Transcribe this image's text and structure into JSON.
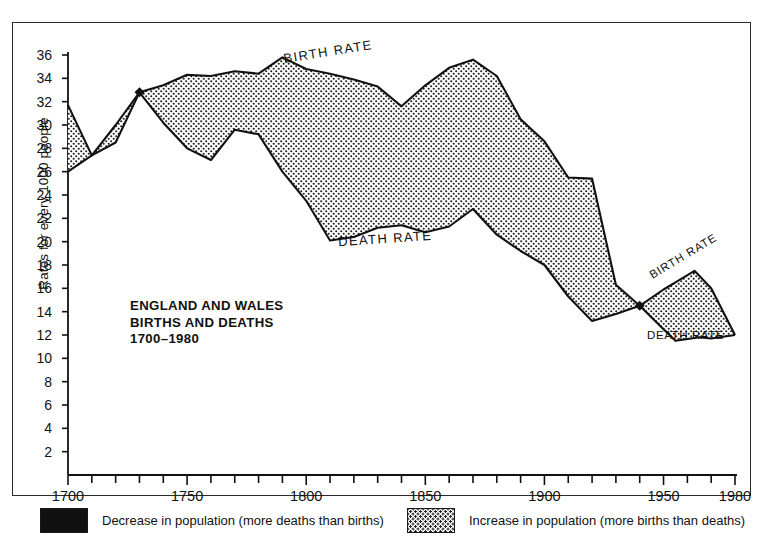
{
  "figure": {
    "title_lines": "ENGLAND AND WALES\nBIRTHS AND DEATHS\n1700–1980",
    "y_axis_label": "Rates for every 1000 people",
    "birth_label": "BIRTH RATE",
    "death_label": "DEATH RATE",
    "birth_label_right": "BIRTH RATE",
    "death_label_right": "DEATH RATE"
  },
  "legend": {
    "decrease": {
      "swatch": "solid-black",
      "text": "Decrease in population (more deaths than births)"
    },
    "increase": {
      "swatch": "dotted-screen",
      "text": "Increase in population (more births than deaths)"
    }
  },
  "colors": {
    "ink": "#111111",
    "fill_increase": "#ffffff",
    "fill_decrease": "#111111",
    "frame": "#2a2a2a"
  },
  "chart_data": {
    "type": "area",
    "xlabel": "",
    "ylabel": "Rates for every 1000 people",
    "xlim": [
      1700,
      1980
    ],
    "ylim": [
      0,
      36
    ],
    "grid": false,
    "legend_position": "below-plot",
    "x_ticks_major": [
      1700,
      1750,
      1800,
      1850,
      1900,
      1950,
      1980
    ],
    "x_ticks_minor_interval": 10,
    "y_ticks": [
      2,
      4,
      6,
      8,
      10,
      12,
      14,
      16,
      18,
      20,
      22,
      24,
      26,
      28,
      30,
      32,
      34,
      36
    ],
    "annotations": [
      {
        "text": "BIRTH RATE",
        "x": 1800,
        "y": 35.8
      },
      {
        "text": "DEATH RATE",
        "x": 1815,
        "y": 19.6
      },
      {
        "text": "BIRTH RATE",
        "x": 1958,
        "y": 17.6
      },
      {
        "text": "DEATH RATE",
        "x": 1962,
        "y": 11.0
      }
    ],
    "crossovers": [
      {
        "year": 1730,
        "rate": 32.8,
        "marker": "black-diamond",
        "note": "deaths exceed births"
      },
      {
        "year": 1940,
        "rate": 14.5,
        "marker": "black-diamond",
        "note": "deaths exceed births"
      }
    ],
    "series": [
      {
        "name": "BIRTH RATE",
        "x": [
          1700,
          1710,
          1720,
          1730,
          1740,
          1750,
          1760,
          1770,
          1780,
          1790,
          1800,
          1810,
          1820,
          1830,
          1840,
          1850,
          1860,
          1870,
          1880,
          1890,
          1900,
          1910,
          1920,
          1930,
          1940,
          1950,
          1963,
          1970,
          1980
        ],
        "values": [
          31.7,
          27.4,
          30.0,
          32.8,
          33.4,
          34.3,
          34.2,
          34.6,
          34.4,
          35.8,
          34.8,
          34.4,
          33.9,
          33.3,
          31.6,
          33.4,
          34.9,
          35.6,
          34.2,
          30.5,
          28.6,
          25.5,
          25.4,
          16.3,
          14.5,
          15.9,
          17.5,
          16.0,
          12.0
        ],
        "label_inside": true
      },
      {
        "name": "DEATH RATE",
        "x": [
          1700,
          1710,
          1720,
          1730,
          1740,
          1750,
          1760,
          1770,
          1780,
          1790,
          1800,
          1810,
          1820,
          1830,
          1840,
          1850,
          1860,
          1870,
          1880,
          1890,
          1900,
          1910,
          1920,
          1930,
          1940,
          1955,
          1965,
          1970,
          1980
        ],
        "values": [
          26.0,
          27.4,
          28.5,
          32.8,
          30.2,
          28.0,
          27.0,
          29.6,
          29.2,
          26.0,
          23.5,
          20.1,
          20.4,
          21.2,
          21.4,
          20.8,
          21.3,
          22.8,
          20.6,
          19.2,
          18.0,
          15.3,
          13.2,
          13.8,
          14.5,
          11.5,
          11.8,
          11.7,
          12.0
        ],
        "label_inside": true
      }
    ]
  }
}
